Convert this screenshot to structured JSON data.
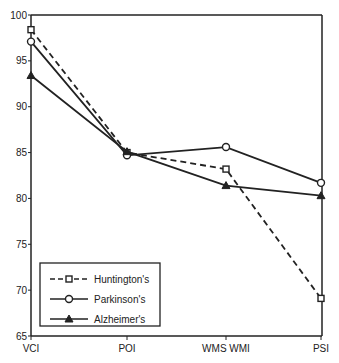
{
  "chart_data": {
    "type": "line",
    "title": "",
    "xlabel": "",
    "ylabel": "",
    "categories": [
      "VCI",
      "POI",
      "WMS WMI",
      "PSI"
    ],
    "ylim": [
      65,
      100
    ],
    "yticks": [
      65,
      70,
      75,
      80,
      85,
      90,
      95,
      100
    ],
    "grid": false,
    "legend_position": "lower left (inside)",
    "series": [
      {
        "name": "Huntington's",
        "marker": "square",
        "line": "dashed",
        "values": [
          98.4,
          85.0,
          83.2,
          69.1
        ]
      },
      {
        "name": "Parkinson's",
        "marker": "circle",
        "line": "solid",
        "values": [
          97.1,
          84.7,
          85.6,
          81.7
        ]
      },
      {
        "name": "Alzheimer's",
        "marker": "triangle",
        "line": "solid",
        "values": [
          93.4,
          85.1,
          81.4,
          80.3
        ]
      }
    ]
  },
  "legend": {
    "items": [
      "Huntington's",
      "Parkinson's",
      "Alzheimer's"
    ]
  },
  "colors": {
    "line": "#222222",
    "background": "#ffffff"
  }
}
